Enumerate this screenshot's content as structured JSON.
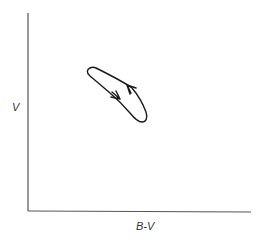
{
  "diagram": {
    "type": "hysteresis-loop",
    "axes": {
      "y_label": "V",
      "x_label": "B-V"
    },
    "loop": {
      "direction_arrows": [
        {
          "segment": "lower-left branch",
          "direction": "down-right"
        },
        {
          "segment": "upper-right branch",
          "direction": "up-left"
        }
      ]
    },
    "colors": {
      "axis": "#555555",
      "curve": "#1a1a1a",
      "background": "#ffffff"
    }
  }
}
